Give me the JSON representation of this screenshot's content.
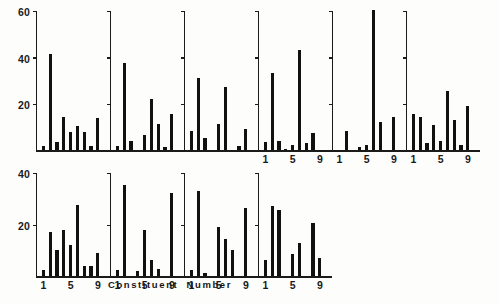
{
  "figure": {
    "axis_title": "Constituent Number",
    "ink_color": "#111111",
    "background_color": "#fdfdfb"
  },
  "chart_data": {
    "type": "bar",
    "title": "",
    "xlabel": "Constituent Number",
    "ylabel": "",
    "grid": false,
    "legend": null,
    "layout": "2 rows of small-multiple panels; top row 6 panels, bottom row 4 panels",
    "rows": [
      {
        "name": "top-row",
        "ylim": [
          0,
          60
        ],
        "yticks": [
          20,
          40,
          60
        ],
        "ytick_labels": [
          "20",
          "40",
          "60"
        ],
        "xticks": [
          1,
          5,
          9
        ],
        "xtick_labels": [
          "1",
          "5",
          "9"
        ],
        "xtick_labels_shown_on_panels": [
          4,
          5,
          6
        ],
        "panels": [
          {
            "name": "panel-1",
            "categories": [
              1,
              2,
              3,
              4,
              5,
              6,
              7,
              8,
              9,
              10
            ],
            "values": [
              2.0,
              41.5,
              3.5,
              14.5,
              8.0,
              10.5,
              8.0,
              2.0,
              14.0,
              0.0
            ]
          },
          {
            "name": "panel-2",
            "categories": [
              1,
              2,
              3,
              4,
              5,
              6,
              7,
              8,
              9,
              10
            ],
            "values": [
              2.0,
              37.5,
              4.0,
              0.0,
              6.5,
              22.0,
              11.5,
              1.5,
              15.5,
              0.0
            ]
          },
          {
            "name": "panel-3",
            "categories": [
              1,
              2,
              3,
              4,
              5,
              6,
              7,
              8,
              9,
              10
            ],
            "values": [
              8.5,
              31.0,
              5.5,
              0.0,
              11.5,
              27.0,
              0.0,
              2.0,
              9.0,
              0.0
            ]
          },
          {
            "name": "panel-4",
            "categories": [
              1,
              2,
              3,
              4,
              5,
              6,
              7,
              8,
              9,
              10
            ],
            "values": [
              3.5,
              33.0,
              4.0,
              0.5,
              2.5,
              43.0,
              3.0,
              7.5,
              0.0,
              0.0
            ]
          },
          {
            "name": "panel-5",
            "categories": [
              1,
              2,
              3,
              4,
              5,
              6,
              7,
              8,
              9,
              10
            ],
            "values": [
              0.0,
              8.5,
              0.0,
              1.5,
              2.5,
              60.0,
              12.0,
              0.0,
              14.5,
              0.0
            ]
          },
          {
            "name": "panel-6",
            "categories": [
              1,
              2,
              3,
              4,
              5,
              6,
              7,
              8,
              9,
              10
            ],
            "values": [
              15.5,
              14.5,
              3.0,
              11.0,
              4.0,
              25.5,
              13.0,
              2.5,
              19.0,
              0.0
            ]
          }
        ]
      },
      {
        "name": "bottom-row",
        "ylim": [
          0,
          40
        ],
        "yticks": [
          20,
          40
        ],
        "ytick_labels": [
          "20",
          "40"
        ],
        "xticks": [
          1,
          5,
          9
        ],
        "xtick_labels": [
          "1",
          "5",
          "9"
        ],
        "xtick_labels_shown_on_panels": [
          1,
          2,
          3,
          4
        ],
        "panels": [
          {
            "name": "panel-1",
            "categories": [
              1,
              2,
              3,
              4,
              5,
              6,
              7,
              8,
              9,
              10
            ],
            "values": [
              2.5,
              17.0,
              10.0,
              18.0,
              12.0,
              27.5,
              4.0,
              4.0,
              9.0,
              0.0
            ]
          },
          {
            "name": "panel-2",
            "categories": [
              1,
              2,
              3,
              4,
              5,
              6,
              7,
              8,
              9,
              10
            ],
            "values": [
              2.5,
              35.0,
              0.0,
              2.0,
              18.0,
              6.5,
              3.0,
              0.0,
              32.0,
              0.0
            ]
          },
          {
            "name": "panel-3",
            "categories": [
              1,
              2,
              3,
              4,
              5,
              6,
              7,
              8,
              9,
              10
            ],
            "values": [
              2.5,
              33.0,
              1.5,
              0.0,
              19.0,
              14.5,
              10.0,
              0.0,
              26.5,
              0.0
            ]
          },
          {
            "name": "panel-4",
            "categories": [
              1,
              2,
              3,
              4,
              5,
              6,
              7,
              8,
              9,
              10
            ],
            "values": [
              6.5,
              27.0,
              25.5,
              0.0,
              8.5,
              13.0,
              0.0,
              20.5,
              7.0,
              0.0
            ]
          }
        ]
      }
    ]
  }
}
